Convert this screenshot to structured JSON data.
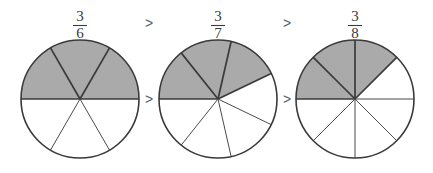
{
  "figure": {
    "background_color": "#ffffff",
    "shaded_color": "#aaaaaa",
    "unshaded_color": "#ffffff",
    "outline_color": "#3a3a3a",
    "operator_color": "#5a5a5a",
    "width": 433,
    "height": 173
  },
  "chart_data": {
    "type": "pie",
    "title": "",
    "xlabel": "",
    "ylabel": "",
    "legend": [],
    "grid": false,
    "items": [
      {
        "label": "3/6",
        "numerator": "3",
        "denominator": "6",
        "total_slices": 6,
        "shaded_slices": 3,
        "slice_angle_degrees": 60,
        "shaded_start_angle_degrees": 180,
        "shaded_sweep_degrees": 180,
        "center_x": 80,
        "center_y": 99,
        "radius": 59,
        "values": [
          1,
          1,
          1,
          1,
          1,
          1
        ],
        "shaded_flags": [
          true,
          true,
          true,
          false,
          false,
          false
        ]
      },
      {
        "label": "3/7",
        "numerator": "3",
        "denominator": "7",
        "total_slices": 7,
        "shaded_slices": 3,
        "slice_angle_degrees": 51.4285714,
        "shaded_start_angle_degrees": 180,
        "shaded_sweep_degrees": 154.2857142,
        "center_x": 218,
        "center_y": 99,
        "radius": 59,
        "values": [
          1,
          1,
          1,
          1,
          1,
          1,
          1
        ],
        "shaded_flags": [
          true,
          true,
          true,
          false,
          false,
          false,
          false
        ]
      },
      {
        "label": "3/8",
        "numerator": "3",
        "denominator": "8",
        "total_slices": 8,
        "shaded_slices": 3,
        "slice_angle_degrees": 45,
        "shaded_start_angle_degrees": 180,
        "shaded_sweep_degrees": 135,
        "center_x": 355,
        "center_y": 99,
        "radius": 59,
        "values": [
          1,
          1,
          1,
          1,
          1,
          1,
          1,
          1
        ],
        "shaded_flags": [
          true,
          true,
          true,
          false,
          false,
          false,
          false,
          false
        ]
      }
    ],
    "operators_top": [
      {
        "symbol": ">",
        "x": 149,
        "y": 24
      },
      {
        "symbol": ">",
        "x": 287,
        "y": 24
      }
    ],
    "operators_middle": [
      {
        "symbol": ">",
        "x": 149,
        "y": 100
      },
      {
        "symbol": ">",
        "x": 287,
        "y": 100
      }
    ],
    "labels_top": [
      {
        "numerator": "3",
        "denominator": "6",
        "x": 80,
        "y": 24
      },
      {
        "numerator": "3",
        "denominator": "7",
        "x": 218,
        "y": 24
      },
      {
        "numerator": "3",
        "denominator": "8",
        "x": 355,
        "y": 24
      }
    ]
  }
}
